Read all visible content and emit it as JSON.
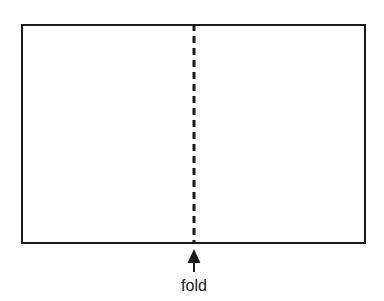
{
  "figure": {
    "background_color": "#ffffff",
    "stroke_color": "#1a1a1a",
    "label": "fold",
    "sheet": {
      "shape": "rectangle",
      "x": 21,
      "y": 24,
      "width": 345,
      "height": 220,
      "stroke_width": 2,
      "fill": "none"
    },
    "fold_line": {
      "orientation": "vertical",
      "style": "dashed",
      "x": 194,
      "y_start": 24,
      "y_end": 244,
      "stroke_width": 3,
      "dash": 7,
      "gap": 5
    },
    "arrow": {
      "direction": "up",
      "tip_x": 194,
      "tip_y": 249,
      "tail_y": 272,
      "head_width": 13,
      "head_height": 14,
      "stem_width": 2
    },
    "label_position": {
      "x": 194,
      "y": 291
    }
  }
}
